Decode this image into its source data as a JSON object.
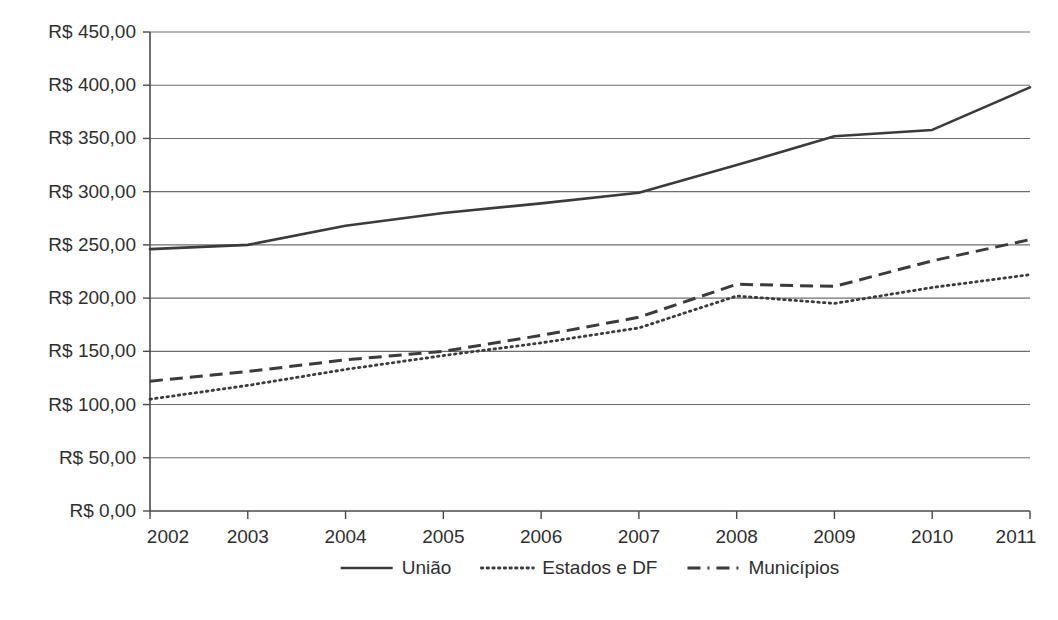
{
  "chart_data": {
    "type": "line",
    "title": "",
    "subtitle": "",
    "xlabel": "",
    "ylabel": "",
    "categories": [
      "2002",
      "2003",
      "2004",
      "2005",
      "2006",
      "2007",
      "2008",
      "2009",
      "2010",
      "2011"
    ],
    "x": [
      2002,
      2003,
      2004,
      2005,
      2006,
      2007,
      2008,
      2009,
      2010,
      2011
    ],
    "ylim": [
      0,
      450
    ],
    "ytick_values": [
      0,
      50,
      100,
      150,
      200,
      250,
      300,
      350,
      400,
      450
    ],
    "ytick_labels": [
      "R$ 0,00",
      "R$ 50,00",
      "R$ 100,00",
      "R$ 150,00",
      "R$ 200,00",
      "R$ 250,00",
      "R$ 300,00",
      "R$ 350,00",
      "R$ 400,00",
      "R$ 450,00"
    ],
    "grid": true,
    "grid_axis": "y",
    "legend_position": "bottom",
    "currency_prefix": "R$",
    "series": [
      {
        "name": "União",
        "style": "solid",
        "color": "#3b3b3b",
        "values": [
          246,
          250,
          268,
          280,
          289,
          299,
          325,
          352,
          358,
          398
        ]
      },
      {
        "name": "Estados e DF",
        "style": "dotted",
        "color": "#3b3b3b",
        "values": [
          105,
          118,
          133,
          146,
          158,
          172,
          202,
          195,
          210,
          222
        ]
      },
      {
        "name": "Municípios",
        "style": "dashed",
        "color": "#3b3b3b",
        "values": [
          122,
          131,
          142,
          150,
          165,
          182,
          213,
          211,
          235,
          255
        ]
      }
    ]
  },
  "legend": {
    "items": [
      {
        "label": "União",
        "style": "solid"
      },
      {
        "label": "Estados e DF",
        "style": "dotted"
      },
      {
        "label": "Municípios",
        "style": "dashed"
      }
    ]
  },
  "axes": {
    "y_labels": [
      "R$ 450,00",
      "R$ 400,00",
      "R$ 350,00",
      "R$ 300,00",
      "R$ 250,00",
      "R$ 200,00",
      "R$ 150,00",
      "R$ 100,00",
      "R$ 50,00",
      "R$ 0,00"
    ],
    "x_labels": [
      "2002",
      "2003",
      "2004",
      "2005",
      "2006",
      "2007",
      "2008",
      "2009",
      "2010",
      "2011"
    ]
  }
}
